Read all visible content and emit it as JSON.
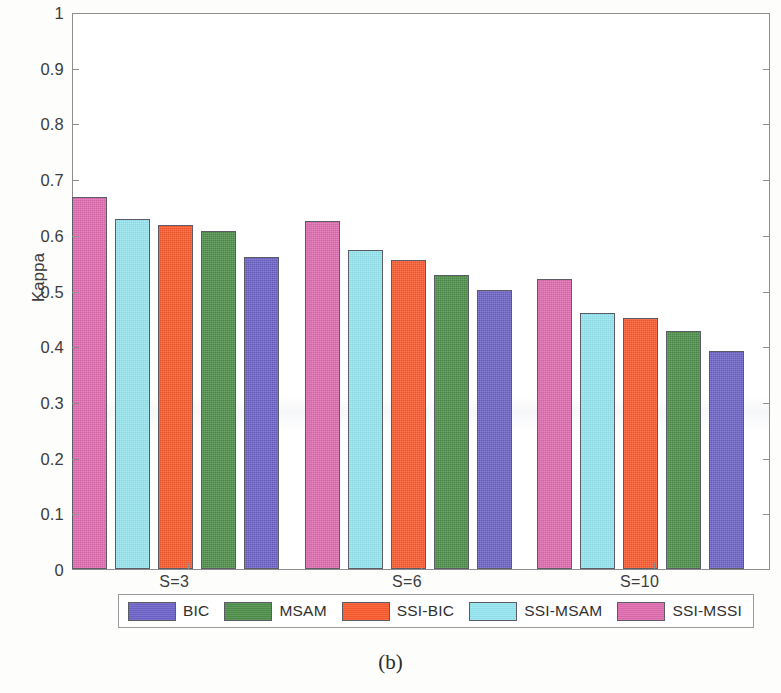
{
  "caption": "(b)",
  "chart_data": {
    "type": "bar",
    "title": "",
    "subtitle": "",
    "xlabel": "",
    "ylabel": "Kappa",
    "ylim": [
      0,
      1
    ],
    "yticks": [
      "0",
      "0.1",
      "0.2",
      "0.3",
      "0.4",
      "0.5",
      "0.6",
      "0.7",
      "0.8",
      "0.9",
      "1"
    ],
    "ytick_values": [
      0,
      0.1,
      0.2,
      0.3,
      0.4,
      0.5,
      0.6,
      0.7,
      0.8,
      0.9,
      1
    ],
    "grid": false,
    "legend_position": "bottom-outside",
    "categories": [
      "S=3",
      "S=6",
      "S=10"
    ],
    "series": [
      {
        "name": "SSI-MSSI",
        "color": "#e06bb0",
        "values": [
          0.667,
          0.625,
          0.521
        ]
      },
      {
        "name": "SSI-MSAM",
        "color": "#96e6f0",
        "values": [
          0.628,
          0.573,
          0.46
        ]
      },
      {
        "name": "SSI-BIC",
        "color": "#fb5a2d",
        "values": [
          0.618,
          0.555,
          0.45
        ]
      },
      {
        "name": "MSAM",
        "color": "#4e8f4a",
        "values": [
          0.607,
          0.528,
          0.428
        ]
      },
      {
        "name": "BIC",
        "color": "#6d63c8",
        "values": [
          0.561,
          0.501,
          0.391
        ]
      }
    ],
    "legend_order": [
      "BIC",
      "MSAM",
      "SSI-BIC",
      "SSI-MSAM",
      "SSI-MSSI"
    ]
  }
}
